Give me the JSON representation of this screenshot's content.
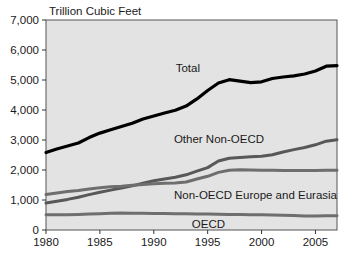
{
  "chart_data": {
    "type": "line",
    "title": "",
    "subtitle": "",
    "xlabel": "",
    "ylabel": "Trillion Cubic Feet",
    "ylabel_position": "top-inside",
    "xlim": [
      1980,
      2007
    ],
    "ylim": [
      0,
      7000
    ],
    "grid": false,
    "legend": "inline-labels",
    "x_tick_labels": [
      "1980",
      "1985",
      "1990",
      "1995",
      "2000",
      "2005"
    ],
    "x_ticks": [
      1980,
      1985,
      1990,
      1995,
      2000,
      2005
    ],
    "y_tick_labels": [
      "0",
      "1,000",
      "2,000",
      "3,000",
      "4,000",
      "5,000",
      "6,000",
      "7,000"
    ],
    "y_ticks": [
      0,
      1000,
      2000,
      3000,
      4000,
      5000,
      6000,
      7000
    ],
    "x": [
      1980,
      1981,
      1982,
      1983,
      1984,
      1985,
      1986,
      1987,
      1988,
      1989,
      1990,
      1991,
      1992,
      1993,
      1994,
      1995,
      1996,
      1997,
      1998,
      1999,
      2000,
      2001,
      2002,
      2003,
      2004,
      2005,
      2006,
      2007
    ],
    "series": [
      {
        "name": "Total",
        "label": "Total",
        "color": "#000000",
        "width": 3.2,
        "values": [
          2580,
          2700,
          2800,
          2900,
          3080,
          3230,
          3340,
          3450,
          3560,
          3700,
          3800,
          3900,
          3990,
          4130,
          4370,
          4650,
          4900,
          5010,
          4960,
          4910,
          4940,
          5050,
          5100,
          5140,
          5200,
          5300,
          5460,
          5480
        ]
      },
      {
        "name": "Other Non-OECD",
        "label": "Other Non-OECD",
        "color": "#585858",
        "width": 3.0,
        "values": [
          900,
          960,
          1020,
          1090,
          1180,
          1260,
          1330,
          1400,
          1470,
          1560,
          1640,
          1700,
          1760,
          1840,
          1960,
          2080,
          2300,
          2390,
          2420,
          2440,
          2460,
          2510,
          2600,
          2680,
          2750,
          2840,
          2960,
          3010
        ]
      },
      {
        "name": "Non-OECD Europe and Eurasia",
        "label": "Non-OECD Europe and Eurasia",
        "color": "#6e6e6e",
        "width": 3.0,
        "values": [
          1180,
          1230,
          1280,
          1320,
          1370,
          1410,
          1440,
          1460,
          1490,
          1520,
          1540,
          1560,
          1570,
          1600,
          1700,
          1790,
          1920,
          1990,
          2010,
          2000,
          1990,
          1990,
          1985,
          1980,
          1980,
          1985,
          1990,
          1995
        ]
      },
      {
        "name": "OECD",
        "label": "OECD",
        "color": "#6e6e6e",
        "width": 3.0,
        "values": [
          505,
          510,
          512,
          518,
          530,
          545,
          560,
          565,
          562,
          558,
          552,
          548,
          545,
          540,
          535,
          530,
          525,
          520,
          515,
          512,
          508,
          500,
          492,
          485,
          470,
          470,
          472,
          474
        ]
      }
    ],
    "series_label_positions": [
      {
        "name": "Total",
        "x": 200,
        "y": 72
      },
      {
        "name": "Other Non-OECD",
        "x": 264,
        "y": 143
      },
      {
        "name": "Non-OECD Europe and Eurasia",
        "x": 337,
        "y": 199
      },
      {
        "name": "OECD",
        "x": 225,
        "y": 228
      }
    ],
    "series_total_right_values": [
      5480,
      6150
    ],
    "notes": ""
  },
  "style": {
    "plot_background": "#e3e3e3",
    "frame_color": "#555555",
    "text_color": "#1a1a1a",
    "page_background": "#ffffff"
  }
}
